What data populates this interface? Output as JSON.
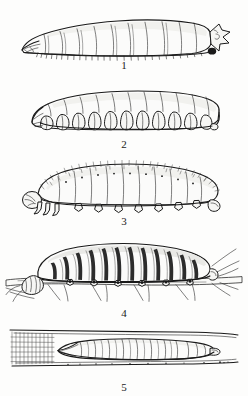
{
  "plate": {
    "title": "Types of insect larvae",
    "background_color": "#fdfdfc",
    "ink_color": "#1a1a1a",
    "width": 248,
    "height": 396,
    "figure_count": 5
  },
  "figures": [
    {
      "number": "1",
      "caption": "1",
      "name": "apodous-maggot-larva",
      "description": "Legless tapered maggot-like larva, head to the left, blunt segmented tail with pointed projection and dark spiracle spot at right",
      "segments": 11,
      "has_legs": false,
      "orientation": "head-left"
    },
    {
      "number": "2",
      "caption": "2",
      "name": "apodous-lobed-grub",
      "description": "Legless grub with deep rounded lateral lobes along the ventral margin, head at left",
      "segments": 11,
      "has_legs": false,
      "orientation": "head-left"
    },
    {
      "number": "3",
      "caption": "3",
      "name": "eruciform-hairy-caterpillar",
      "description": "Arched hairy caterpillar bearing setae over the dorsum, thoracic legs and abdominal prolegs beneath",
      "segments": 12,
      "has_legs": true,
      "prolegs": 8,
      "orientation": "head-left"
    },
    {
      "number": "4",
      "caption": "4",
      "name": "striped-caterpillar-on-twig",
      "description": "Boldly striped caterpillar clasping a horizontal twig, dark transverse bands, prolegs gripping the branch",
      "segments": 12,
      "has_legs": true,
      "on_substrate": "twig",
      "orientation": "head-left"
    },
    {
      "number": "5",
      "caption": "5",
      "name": "leaf-miner-larva-in-tunnel",
      "description": "Flattened legless leaf-mining larva lying inside a tunnel between two leaf surfaces, hatched plant tissue at the left end",
      "segments": 12,
      "has_legs": false,
      "in_substrate": "leaf-mine-tunnel",
      "orientation": "head-left"
    }
  ]
}
